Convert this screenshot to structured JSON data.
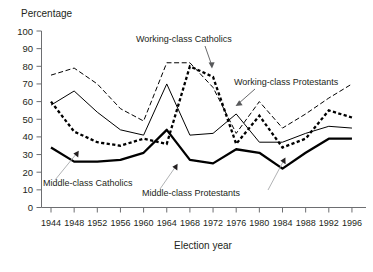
{
  "chart_data": {
    "type": "line",
    "title": "",
    "xlabel": "Election year",
    "ylabel": "Percentage",
    "ylim": [
      0,
      100
    ],
    "ytick_step": 10,
    "yticks": [
      0,
      10,
      20,
      30,
      40,
      50,
      60,
      70,
      80,
      90,
      100
    ],
    "grid": false,
    "legend": "inline-annotations",
    "categories": [
      1944,
      1948,
      1952,
      1956,
      1960,
      1964,
      1968,
      1972,
      1976,
      1980,
      1984,
      1988,
      1992,
      1996
    ],
    "x_tick_labels": [
      "1944",
      "1948",
      "1952",
      "1956",
      "1960",
      "1964",
      "1968",
      "1972",
      "1976",
      "1980",
      "1984",
      "1988",
      "1992",
      "1996"
    ],
    "series": [
      {
        "name": "Working-class Catholics",
        "style": "thin-dashed",
        "values": [
          75,
          79,
          70,
          56,
          49,
          82,
          82,
          68,
          42,
          60,
          45,
          53,
          62,
          70
        ]
      },
      {
        "name": "Working-class Protestants",
        "style": "thick-dotted",
        "values": [
          60,
          43,
          37,
          35,
          39,
          36,
          80,
          74,
          36,
          52,
          34,
          39,
          55,
          51
        ]
      },
      {
        "name": "Middle-class Catholics",
        "style": "thin-solid",
        "values": [
          58,
          66,
          54,
          44,
          41,
          70,
          41,
          42,
          53,
          37,
          37,
          42,
          46,
          45
        ]
      },
      {
        "name": "Middle-class Protestants",
        "style": "thick-solid",
        "values": [
          34,
          26,
          26,
          27,
          31,
          44,
          27,
          25,
          33,
          31,
          22,
          31,
          39,
          39
        ]
      }
    ],
    "annotations": [
      {
        "text": "Working-class Catholics",
        "points_to_series": "Working-class Catholics"
      },
      {
        "text": "Working-class Protestants",
        "points_to_series": "Working-class Protestants"
      },
      {
        "text": "Middle-class Catholics",
        "points_to_series": "Middle-class Catholics"
      },
      {
        "text": "Middle-class Protestants",
        "points_to_series": "Middle-class Protestants"
      }
    ]
  },
  "labels": {
    "y_axis_title": "Percentage",
    "x_axis_title": "Election year",
    "ann_wc_catholics": "Working-class Catholics",
    "ann_wc_protestants": "Working-class Protestants",
    "ann_mc_catholics": "Middle-class Catholics",
    "ann_mc_protestants": "Middle-class Protestants",
    "y": {
      "t100": "100",
      "t90": "90",
      "t80": "80",
      "t70": "70",
      "t60": "60",
      "t50": "50",
      "t40": "40",
      "t30": "30",
      "t20": "20",
      "t10": "10",
      "t0": "0"
    },
    "x": {
      "x0": "1944",
      "x1": "1948",
      "x2": "1952",
      "x3": "1956",
      "x4": "1960",
      "x5": "1964",
      "x6": "1968",
      "x7": "1972",
      "x8": "1976",
      "x9": "1980",
      "x10": "1984",
      "x11": "1988",
      "x12": "1992",
      "x13": "1996"
    }
  },
  "colors": {
    "ink": "#231f20",
    "axis": "#6d6e71",
    "leader": "#a7a9ac",
    "series": "#000000",
    "background": "#ffffff"
  }
}
